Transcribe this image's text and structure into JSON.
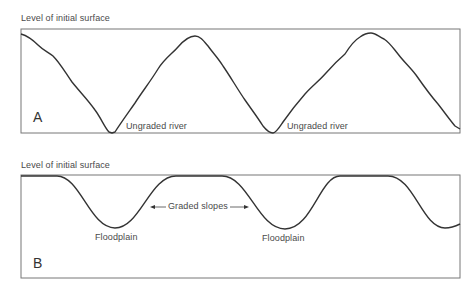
{
  "panels": [
    {
      "id": "A",
      "letter": "A",
      "top_label": "Level of initial surface",
      "annotations": [
        "Ungraded river",
        "Ungraded river"
      ]
    },
    {
      "id": "B",
      "letter": "B",
      "top_label": "Level of initial surface",
      "annotations": {
        "slopes": "Graded slopes",
        "floodplain_1": "Floodplain",
        "floodplain_2": "Floodplain"
      }
    }
  ],
  "colors": {
    "line": "#333333",
    "frame": "#666666",
    "text": "#4a4a4a"
  }
}
